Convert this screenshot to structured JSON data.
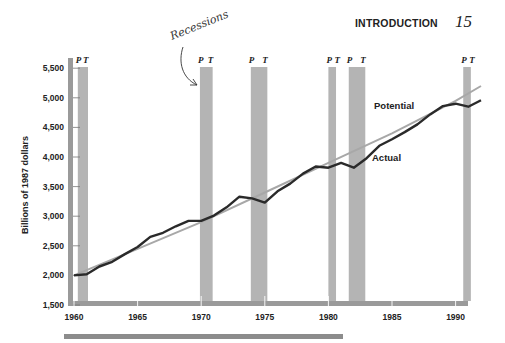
{
  "header": {
    "section_title": "INTRODUCTION",
    "page_number": "15"
  },
  "annotation": {
    "handwritten_label": "Recessions"
  },
  "legend": {
    "potential_label": "Potential",
    "actual_label": "Actual"
  },
  "axes": {
    "ylabel": "Billions of 1987 dollars",
    "yticks": [
      "1,500",
      "2,000",
      "2,500",
      "3,000",
      "3,500",
      "4,000",
      "4,500",
      "5,000",
      "5,500"
    ],
    "xticks": [
      "1960",
      "1965",
      "1970",
      "1975",
      "1980",
      "1985",
      "1990"
    ]
  },
  "recession_markers": {
    "peak": "P",
    "trough": "T"
  },
  "colors": {
    "actual_line": "#2a2a2a",
    "potential_line": "#a8a8a8",
    "recession_band": "#b4b4b4",
    "axis_bar": "#9a9a9a"
  },
  "chart_data": {
    "type": "line",
    "title": "",
    "xlabel": "",
    "ylabel": "Billions of 1987 dollars",
    "xlim": [
      1960,
      1992
    ],
    "ylim": [
      1500,
      5500
    ],
    "grid": false,
    "legend_position": "inline labels",
    "series": [
      {
        "name": "Potential",
        "x": [
          1960,
          1965,
          1970,
          1975,
          1980,
          1985,
          1990,
          1992
        ],
        "values": [
          2000,
          2450,
          2900,
          3400,
          3900,
          4400,
          4950,
          5200
        ]
      },
      {
        "name": "Actual",
        "x": [
          1960,
          1961,
          1962,
          1963,
          1964,
          1965,
          1966,
          1967,
          1968,
          1969,
          1970,
          1971,
          1972,
          1973,
          1974,
          1975,
          1976,
          1977,
          1978,
          1979,
          1980,
          1981,
          1982,
          1983,
          1984,
          1985,
          1986,
          1987,
          1988,
          1989,
          1990,
          1991,
          1992
        ],
        "values": [
          2000,
          2020,
          2150,
          2230,
          2360,
          2480,
          2650,
          2720,
          2830,
          2920,
          2920,
          3010,
          3150,
          3330,
          3300,
          3230,
          3420,
          3550,
          3720,
          3840,
          3820,
          3900,
          3820,
          3980,
          4190,
          4300,
          4420,
          4550,
          4720,
          4860,
          4900,
          4850,
          4960
        ]
      }
    ],
    "recessions": [
      {
        "peak": 1960.3,
        "trough": 1961.1
      },
      {
        "peak": 1969.9,
        "trough": 1970.9
      },
      {
        "peak": 1973.9,
        "trough": 1975.2
      },
      {
        "peak": 1980.0,
        "trough": 1980.6
      },
      {
        "peak": 1981.6,
        "trough": 1982.9
      },
      {
        "peak": 1990.6,
        "trough": 1991.2
      }
    ],
    "annotations": [
      "Recessions",
      "Potential",
      "Actual",
      "P",
      "T"
    ]
  }
}
